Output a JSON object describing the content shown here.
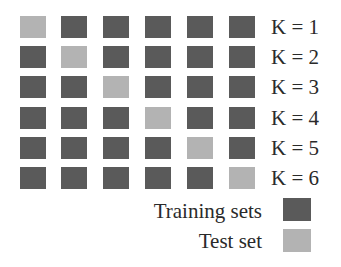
{
  "colors": {
    "training": "#5a5a5a",
    "test": "#b3b3b3"
  },
  "folds": [
    {
      "label": "K = 1",
      "test_index": 0
    },
    {
      "label": "K = 2",
      "test_index": 1
    },
    {
      "label": "K = 3",
      "test_index": 2
    },
    {
      "label": "K = 4",
      "test_index": 3
    },
    {
      "label": "K = 5",
      "test_index": 4
    },
    {
      "label": "K = 6",
      "test_index": 5
    }
  ],
  "num_blocks": 6,
  "legend": {
    "training": {
      "label": "Training sets"
    },
    "test": {
      "label": "Test set"
    }
  }
}
